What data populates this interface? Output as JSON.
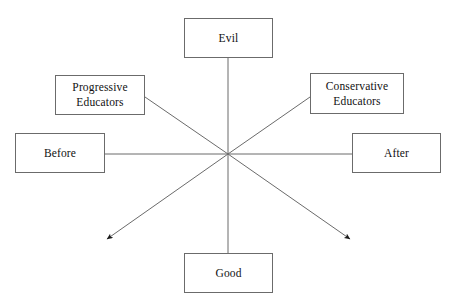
{
  "diagram": {
    "type": "axis-quadrant-diagram",
    "background_color": "#ffffff",
    "line_color": "#6b6b6b",
    "box_border_color": "#6b6b6b",
    "text_color": "#111111",
    "center_point": {
      "x": 228,
      "y": 154
    },
    "nodes": [
      {
        "id": "evil",
        "label": "Evil",
        "x": 184,
        "y": 18,
        "w": 89,
        "h": 40,
        "axis": "vertical-top"
      },
      {
        "id": "good",
        "label": "Good",
        "x": 184,
        "y": 253,
        "w": 89,
        "h": 40,
        "axis": "vertical-bottom"
      },
      {
        "id": "before",
        "label": "Before",
        "x": 15,
        "y": 133,
        "w": 90,
        "h": 40,
        "axis": "horizontal-left"
      },
      {
        "id": "after",
        "label": "After",
        "x": 352,
        "y": 133,
        "w": 89,
        "h": 40,
        "axis": "horizontal-right"
      },
      {
        "id": "progressive-educators",
        "label": "Progressive\nEducators",
        "x": 55,
        "y": 75,
        "w": 90,
        "h": 40,
        "axis": "diagonal-upper-left"
      },
      {
        "id": "conservative-educators",
        "label": "Conservative\nEducators",
        "x": 310,
        "y": 73,
        "w": 94,
        "h": 41,
        "axis": "diagonal-upper-right"
      }
    ],
    "connectors": [
      {
        "id": "evil-axis",
        "from": [
          228,
          58
        ],
        "to": [
          228,
          154
        ],
        "arrow": false
      },
      {
        "id": "good-axis",
        "from": [
          228,
          154
        ],
        "to": [
          228,
          253
        ],
        "arrow": false
      },
      {
        "id": "before-axis",
        "from": [
          105,
          154
        ],
        "to": [
          228,
          154
        ],
        "arrow": false
      },
      {
        "id": "after-axis",
        "from": [
          228,
          154
        ],
        "to": [
          352,
          154
        ],
        "arrow": false
      },
      {
        "id": "progressive-axis",
        "from": [
          145,
          97
        ],
        "to": [
          228,
          154
        ],
        "arrow": false
      },
      {
        "id": "conservative-axis",
        "from": [
          310,
          97
        ],
        "to": [
          228,
          154
        ],
        "arrow": false
      },
      {
        "id": "lower-left-arrow",
        "from": [
          228,
          154
        ],
        "to": [
          102,
          242
        ],
        "arrow": true
      },
      {
        "id": "lower-right-arrow",
        "from": [
          228,
          154
        ],
        "to": [
          355,
          243
        ],
        "arrow": true
      }
    ]
  }
}
